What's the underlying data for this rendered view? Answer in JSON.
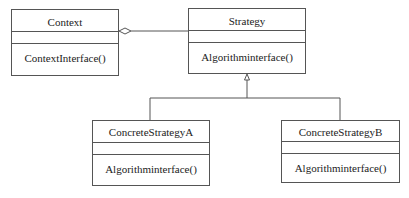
{
  "diagram": {
    "type": "UML class diagram",
    "pattern": "Strategy",
    "line_color": "#555555",
    "classes": [
      {
        "id": "context",
        "name": "Context",
        "attributes": [],
        "operations": [
          "ContextInterface()"
        ]
      },
      {
        "id": "strategy",
        "name": "Strategy",
        "attributes": [],
        "operations": [
          "Algorithminterface()"
        ]
      },
      {
        "id": "concrete_a",
        "name": "ConcreteStrategyA",
        "attributes": [],
        "operations": [
          "Algorithminterface()"
        ]
      },
      {
        "id": "concrete_b",
        "name": "ConcreteStrategyB",
        "attributes": [],
        "operations": [
          "Algorithminterface()"
        ]
      }
    ],
    "relationships": [
      {
        "type": "aggregation",
        "from": "Context",
        "to": "Strategy"
      },
      {
        "type": "generalization",
        "from": "ConcreteStrategyA",
        "to": "Strategy"
      },
      {
        "type": "generalization",
        "from": "ConcreteStrategyB",
        "to": "Strategy"
      }
    ]
  }
}
